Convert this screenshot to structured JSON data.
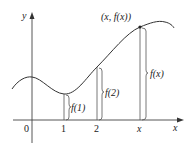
{
  "diagram": {
    "type": "function-graph",
    "axes": {
      "x_label": "x",
      "y_label": "y",
      "origin_label": "0"
    },
    "ticks": [
      {
        "label": "1",
        "italic": false
      },
      {
        "label": "2",
        "italic": false
      },
      {
        "label": "x",
        "italic": true
      }
    ],
    "point_label": "(x, f(x))",
    "heights": [
      {
        "label": "f(1)"
      },
      {
        "label": "f(2)"
      },
      {
        "label": "f(x)"
      }
    ],
    "colors": {
      "curve": "#333333",
      "axes": "#444444",
      "lines": "#555555",
      "background": "#ffffff"
    }
  }
}
